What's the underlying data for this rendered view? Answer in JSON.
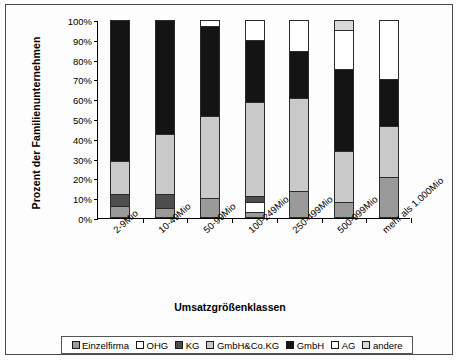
{
  "chart_data": {
    "type": "bar",
    "subtype": "stacked-100-percent",
    "title": "",
    "xlabel": "Umsatzgrößenklassen",
    "ylabel": "Prozent der Familienunternehmen",
    "ylim": [
      0,
      100
    ],
    "ytick_labels": [
      "0%",
      "10%",
      "20%",
      "30%",
      "40%",
      "50%",
      "60%",
      "70%",
      "80%",
      "90%",
      "100%"
    ],
    "ytick_values": [
      0,
      10,
      20,
      30,
      40,
      50,
      60,
      70,
      80,
      90,
      100
    ],
    "grid": false,
    "legend_position": "bottom",
    "categories": [
      "2-9Mio",
      "10-49Mio",
      "50-99Mio",
      "100-249Mio",
      "250-499Mio",
      "500-999Mio",
      "mehr als 1.000Mio"
    ],
    "series": [
      {
        "name": "Einzelfirma",
        "color": "#9a9a9a",
        "values": [
          5,
          4,
          9,
          2,
          13,
          7,
          20
        ]
      },
      {
        "name": "OHG",
        "color": "#ffffff",
        "values": [
          0,
          0,
          0,
          5,
          0,
          0,
          0
        ]
      },
      {
        "name": "KG",
        "color": "#4d4d4d",
        "values": [
          6,
          7,
          0,
          3,
          0,
          0,
          0
        ]
      },
      {
        "name": "GmbH&Co.KG",
        "color": "#c9c9c9",
        "values": [
          17,
          31,
          42,
          48,
          47,
          26,
          26
        ]
      },
      {
        "name": "GmbH",
        "color": "#141414",
        "values": [
          72,
          58,
          46,
          32,
          24,
          42,
          24
        ]
      },
      {
        "name": "AG",
        "color": "#ffffff",
        "values": [
          0,
          0,
          3,
          10,
          16,
          20,
          30
        ]
      },
      {
        "name": "andere",
        "color": "#d8d8d8",
        "values": [
          0,
          0,
          0,
          0,
          0,
          5,
          0
        ]
      }
    ]
  },
  "legend": {
    "items": [
      {
        "label": "Einzelfirma"
      },
      {
        "label": "OHG"
      },
      {
        "label": "KG"
      },
      {
        "label": "GmbH&Co.KG"
      },
      {
        "label": "GmbH"
      },
      {
        "label": "AG"
      },
      {
        "label": "andere"
      }
    ]
  }
}
